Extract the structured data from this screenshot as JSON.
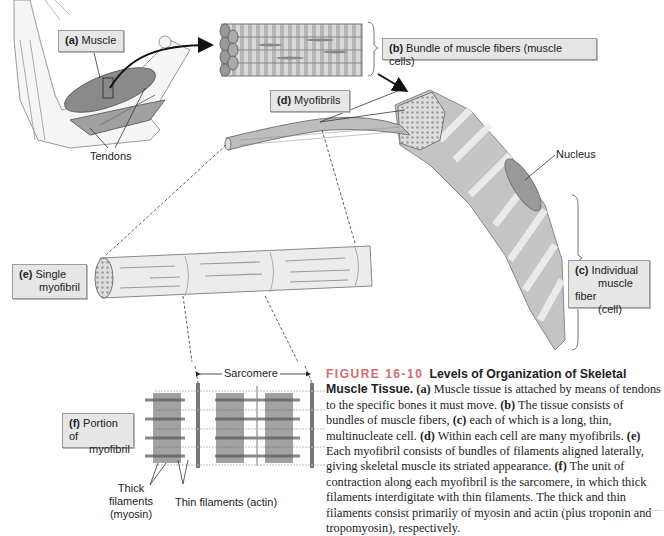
{
  "figure": {
    "number_label": "FIGURE 16-10",
    "title": "Levels of Organization of Skeletal Muscle Tissue.",
    "caption_parts": [
      {
        "letter": "(a)",
        "text": " Muscle tissue is attached by means of tendons to the specific bones it must move. "
      },
      {
        "letter": "(b)",
        "text": " The tissue consists of bundles of muscle fibers, "
      },
      {
        "letter": "(c)",
        "text": " each of which is a long, thin, multinucleate cell. "
      },
      {
        "letter": "(d)",
        "text": " Within each cell are many myofibrils. "
      },
      {
        "letter": "(e)",
        "text": " Each myofibril consists of bundles of filaments aligned laterally, giving skeletal muscle its striated appearance. "
      },
      {
        "letter": "(f)",
        "text": " The unit of contraction along each myofibril is the sarcomere, in which thick filaments interdigitate with thin filaments. The thick and thin filaments consist primarily of myosin and actin (plus troponin and tropomyosin), respectively."
      }
    ]
  },
  "labels": {
    "a": {
      "letter": "(a)",
      "text": "Muscle"
    },
    "b": {
      "letter": "(b)",
      "text": "Bundle of muscle fibers (muscle cells)"
    },
    "c": {
      "letter": "(c)",
      "line1": "Individual",
      "line2": "muscle fiber",
      "line3": "(cell)"
    },
    "d": {
      "letter": "(d)",
      "text": "Myofibrils"
    },
    "e": {
      "letter": "(e)",
      "line1": "Single",
      "line2": "myofibril"
    },
    "f": {
      "letter": "(f)",
      "line1": "Portion of",
      "line2": "myofibril"
    }
  },
  "annotations": {
    "tendons": "Tendons",
    "nucleus": "Nucleus",
    "sarcomere": "Sarcomere",
    "thick_filaments_1": "Thick filaments",
    "thick_filaments_2": "(myosin)",
    "thin_filaments": "Thin filaments (actin)"
  }
}
